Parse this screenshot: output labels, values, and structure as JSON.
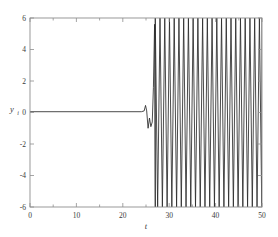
{
  "chart_data": {
    "type": "line",
    "title": "",
    "subtitle": "",
    "xlabel": "t",
    "ylabel": "y",
    "ylabel_sub": "i",
    "xlim": [
      0,
      50
    ],
    "ylim": [
      -6,
      6
    ],
    "grid": false,
    "legend": null,
    "legend_position": "none",
    "box": true,
    "tick_direction": "in",
    "x_ticks": [
      0,
      10,
      20,
      30,
      40,
      50
    ],
    "x_tick_labels": [
      "0",
      "10",
      "20",
      "30",
      "40",
      "50"
    ],
    "x_minor_ticks": [
      5,
      15,
      25,
      35,
      45
    ],
    "y_ticks": [
      -6,
      -4,
      -2,
      0,
      2,
      4,
      6
    ],
    "y_tick_labels": [
      "-6",
      "-4",
      "-2",
      "0",
      "2",
      "4",
      "6"
    ],
    "line_color": "#2b2b2b",
    "axis_color": "#8e8e8e",
    "background_color": "#ffffff",
    "series": [
      {
        "name": "y_i",
        "regime_flat": {
          "t_start": 0,
          "t_end": 24.0,
          "value": 0.05
        },
        "regime_transient": {
          "points": [
            [
              24.0,
              0.05
            ],
            [
              24.6,
              0.1
            ],
            [
              24.9,
              0.45
            ],
            [
              25.15,
              0.1
            ],
            [
              25.45,
              -1.0
            ],
            [
              25.75,
              -0.35
            ],
            [
              26.05,
              -0.9
            ],
            [
              26.35,
              -0.6
            ],
            [
              26.6,
              1.6
            ],
            [
              26.85,
              5.6
            ],
            [
              27.0,
              -6.0
            ]
          ]
        },
        "regime_oscillation": {
          "t_start": 27.0,
          "t_end": 50.0,
          "period": 1.02,
          "amplitude_min": -6.0,
          "amplitude_max": 6.0,
          "cycle_count": 23,
          "description": "Near-vertical alternating excursions between the upper and lower plot limits."
        }
      }
    ]
  },
  "axes_geometry": {
    "left_px": 30,
    "right_px": 262,
    "top_px": 18,
    "bottom_px": 207
  }
}
